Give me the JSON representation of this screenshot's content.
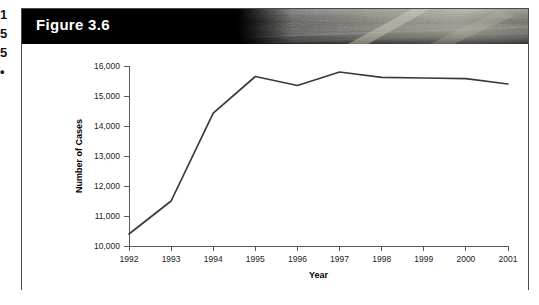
{
  "page": {
    "margin_glyphs": [
      "1",
      "5",
      "5",
      "•"
    ],
    "background_color": "#ffffff"
  },
  "figure": {
    "label": "Figure 3.6",
    "header_background": "#000000",
    "header_text_color": "#ffffff",
    "border_color": "#4a4a4a"
  },
  "chart_data": {
    "type": "line",
    "title": "Figure 3.6",
    "xlabel": "Year",
    "ylabel": "Number of Cases",
    "x": [
      1992,
      1993,
      1994,
      1995,
      1996,
      1997,
      1998,
      1999,
      2000,
      2001
    ],
    "categories": [
      "1992",
      "1993",
      "1994",
      "1995",
      "1996",
      "1997",
      "1998",
      "1999",
      "2000",
      "2001"
    ],
    "values": [
      10400,
      11500,
      14430,
      15650,
      15350,
      15800,
      15620,
      15600,
      15580,
      15400
    ],
    "series": [
      {
        "name": "Number of Cases",
        "values": [
          10400,
          11500,
          14430,
          15650,
          15350,
          15800,
          15620,
          15600,
          15580,
          15400
        ]
      }
    ],
    "ylim": [
      10000,
      16000
    ],
    "xlim": [
      1992,
      2001
    ],
    "yticks": [
      10000,
      11000,
      12000,
      13000,
      14000,
      15000,
      16000
    ],
    "ytick_labels": [
      "10,000",
      "11,000",
      "12,000",
      "13,000",
      "14,000",
      "15,000",
      "16,000"
    ],
    "xticks": [
      1992,
      1993,
      1994,
      1995,
      1996,
      1997,
      1998,
      1999,
      2000,
      2001
    ],
    "xtick_labels": [
      "1992",
      "1993",
      "1994",
      "1995",
      "1996",
      "1997",
      "1998",
      "1999",
      "2000",
      "2001"
    ],
    "grid": false,
    "legend": null,
    "line_color": "#3a3a3a",
    "markers": false
  }
}
